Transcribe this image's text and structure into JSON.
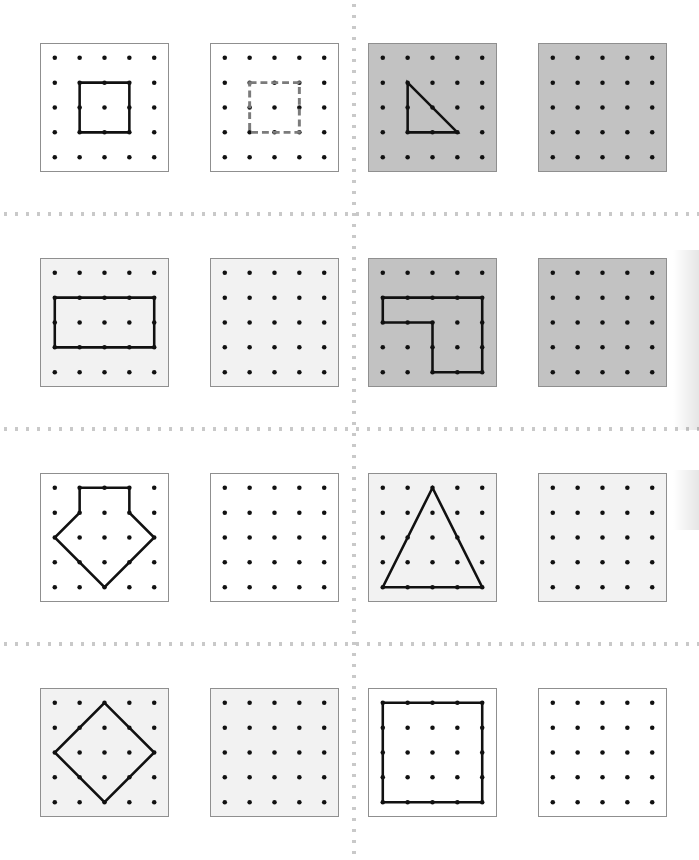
{
  "page": {
    "width": 699,
    "height": 860,
    "background": "#ffffff"
  },
  "colors": {
    "peg": "#111111",
    "shape_solid": "#111111",
    "shape_dashed": "#7b7b7b",
    "panel_border": "#8f8f8f",
    "panel_white": "#ffffff",
    "panel_light": "#f2f2f2",
    "panel_gray": "#c2c2c2",
    "divider_dot": "#c9c9c9"
  },
  "grid": {
    "rows": 4,
    "cols": 4,
    "pegs_per_side": 5,
    "panel_size": 129,
    "col_x": [
      40,
      210,
      368,
      538
    ],
    "row_y": [
      43,
      258,
      473,
      688
    ],
    "divider_y": [
      212,
      427,
      642
    ],
    "divider_x": [
      352
    ]
  },
  "panels": [
    {
      "id": "r1c1",
      "row": 0,
      "col": 0,
      "fill": "#ffffff",
      "shape_name": "square-small",
      "stroke_style": "solid",
      "points": [
        [
          1,
          1
        ],
        [
          3,
          1
        ],
        [
          3,
          3
        ],
        [
          1,
          3
        ]
      ],
      "closed": true
    },
    {
      "id": "r1c2",
      "row": 0,
      "col": 1,
      "fill": "#ffffff",
      "shape_name": "square-small-dashed",
      "stroke_style": "dashed",
      "points": [
        [
          1,
          1
        ],
        [
          3,
          1
        ],
        [
          3,
          3
        ],
        [
          1,
          3
        ]
      ],
      "closed": true
    },
    {
      "id": "r1c3",
      "row": 0,
      "col": 2,
      "fill": "#c2c2c2",
      "shape_name": "right-triangle",
      "stroke_style": "solid",
      "points": [
        [
          1,
          1
        ],
        [
          3,
          3
        ],
        [
          1,
          3
        ]
      ],
      "closed": true
    },
    {
      "id": "r1c4",
      "row": 0,
      "col": 3,
      "fill": "#c2c2c2",
      "shape_name": "empty-board",
      "stroke_style": "none",
      "points": [],
      "closed": false
    },
    {
      "id": "r2c1",
      "row": 1,
      "col": 0,
      "fill": "#f2f2f2",
      "shape_name": "rectangle-wide",
      "stroke_style": "solid",
      "points": [
        [
          0,
          1
        ],
        [
          4,
          1
        ],
        [
          4,
          3
        ],
        [
          0,
          3
        ]
      ],
      "closed": true
    },
    {
      "id": "r2c2",
      "row": 1,
      "col": 1,
      "fill": "#f2f2f2",
      "shape_name": "empty-board",
      "stroke_style": "none",
      "points": [],
      "closed": false
    },
    {
      "id": "r2c3",
      "row": 1,
      "col": 2,
      "fill": "#c2c2c2",
      "shape_name": "l-shape",
      "stroke_style": "solid",
      "points": [
        [
          0,
          1
        ],
        [
          4,
          1
        ],
        [
          4,
          4
        ],
        [
          2,
          4
        ],
        [
          2,
          2
        ],
        [
          0,
          2
        ]
      ],
      "closed": true
    },
    {
      "id": "r2c4",
      "row": 1,
      "col": 3,
      "fill": "#c2c2c2",
      "shape_name": "empty-board",
      "stroke_style": "none",
      "points": [],
      "closed": false
    },
    {
      "id": "r3c1",
      "row": 2,
      "col": 0,
      "fill": "#ffffff",
      "shape_name": "arrow-pentagon",
      "stroke_style": "solid",
      "points": [
        [
          1,
          0
        ],
        [
          3,
          0
        ],
        [
          3,
          1
        ],
        [
          4,
          2
        ],
        [
          2,
          4
        ],
        [
          0,
          2
        ],
        [
          1,
          1
        ]
      ],
      "closed": true
    },
    {
      "id": "r3c2",
      "row": 2,
      "col": 1,
      "fill": "#ffffff",
      "shape_name": "empty-board",
      "stroke_style": "none",
      "points": [],
      "closed": false
    },
    {
      "id": "r3c3",
      "row": 2,
      "col": 2,
      "fill": "#f2f2f2",
      "shape_name": "tall-triangle",
      "stroke_style": "solid",
      "points": [
        [
          0,
          4
        ],
        [
          4,
          4
        ],
        [
          2,
          0
        ]
      ],
      "closed": true
    },
    {
      "id": "r3c4",
      "row": 2,
      "col": 3,
      "fill": "#f2f2f2",
      "shape_name": "empty-board",
      "stroke_style": "none",
      "points": [],
      "closed": false
    },
    {
      "id": "r4c1",
      "row": 3,
      "col": 0,
      "fill": "#f2f2f2",
      "shape_name": "diamond",
      "stroke_style": "solid",
      "points": [
        [
          2,
          0
        ],
        [
          4,
          2
        ],
        [
          2,
          4
        ],
        [
          0,
          2
        ]
      ],
      "closed": true
    },
    {
      "id": "r4c2",
      "row": 3,
      "col": 1,
      "fill": "#f2f2f2",
      "shape_name": "empty-board",
      "stroke_style": "none",
      "points": [],
      "closed": false
    },
    {
      "id": "r4c3",
      "row": 3,
      "col": 2,
      "fill": "#ffffff",
      "shape_name": "square-full",
      "stroke_style": "solid",
      "points": [
        [
          0,
          0
        ],
        [
          4,
          0
        ],
        [
          4,
          4
        ],
        [
          0,
          4
        ]
      ],
      "closed": true
    },
    {
      "id": "r4c4",
      "row": 3,
      "col": 3,
      "fill": "#ffffff",
      "shape_name": "empty-board",
      "stroke_style": "none",
      "points": [],
      "closed": false
    }
  ]
}
